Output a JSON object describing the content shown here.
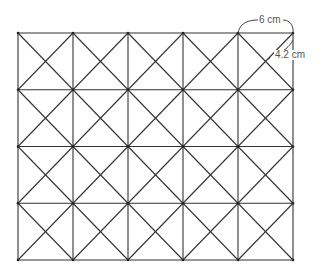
{
  "diagram": {
    "grid": {
      "columns": 5,
      "rows": 4,
      "left": 18,
      "top": 33,
      "cell_width": 55,
      "cell_height": 56.75,
      "line_color": "#333333"
    },
    "labels": {
      "width_label": "6 cm",
      "diagonal_label": "4.2 cm"
    }
  }
}
